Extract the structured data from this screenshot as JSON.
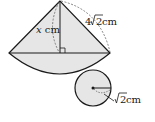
{
  "diagram": {
    "type": "cone-net",
    "labels": {
      "height": "x cm",
      "height_var": "x",
      "height_unit": " cm",
      "slant": "4√2 cm",
      "slant_coef": "4",
      "slant_root": "2",
      "slant_unit": " cm",
      "radius": "√2 cm",
      "radius_root": "2",
      "radius_unit": " cm"
    },
    "colors": {
      "fill": "#e6e6e6",
      "stroke": "#1a1a1a",
      "dashed": "#555555"
    }
  }
}
